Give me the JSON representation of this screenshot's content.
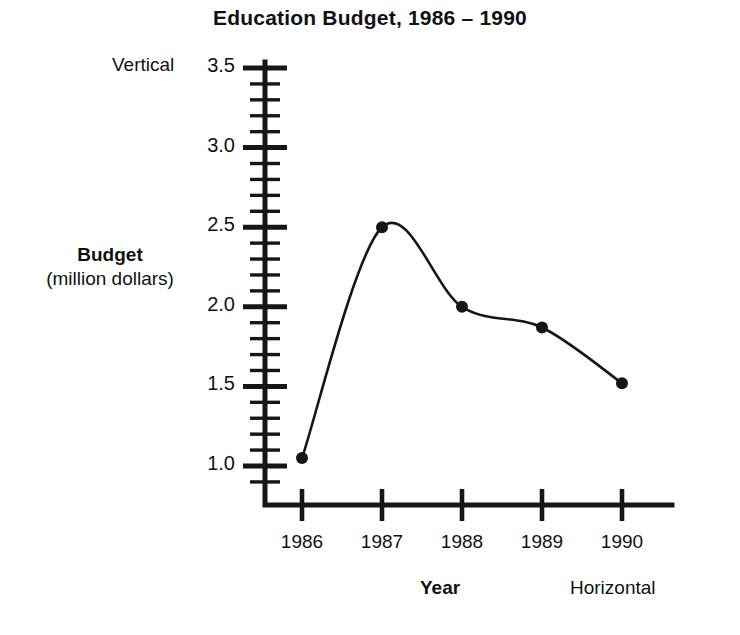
{
  "chart_data": {
    "type": "line",
    "title": "Education Budget, 1986 – 1990",
    "xlabel": "Year",
    "ylabel": "Budget",
    "ylabel_sub": "(million dollars)",
    "categories": [
      "1986",
      "1987",
      "1988",
      "1989",
      "1990"
    ],
    "values": [
      1.05,
      2.5,
      2.0,
      1.87,
      1.52
    ],
    "x": [
      1986,
      1987,
      1988,
      1989,
      1990
    ],
    "ylim": [
      0.8,
      3.6
    ],
    "xlim": [
      1985.6,
      1990.5
    ],
    "y_major_ticks": [
      "1.0",
      "1.5",
      "2.0",
      "2.5",
      "3.0",
      "3.5"
    ],
    "y_major_values": [
      1.0,
      1.5,
      2.0,
      2.5,
      3.0,
      3.5
    ],
    "y_minor_step": 0.1,
    "grid": false,
    "legend": null,
    "marker": "filled-circle",
    "line_style": "smooth-curve",
    "series_color": "#161616",
    "annotations": {
      "vertical_axis_note": "Vertical",
      "horizontal_axis_note": "Horizontal"
    }
  },
  "axis_notes": {
    "vertical": "Vertical",
    "horizontal": "Horizontal"
  }
}
